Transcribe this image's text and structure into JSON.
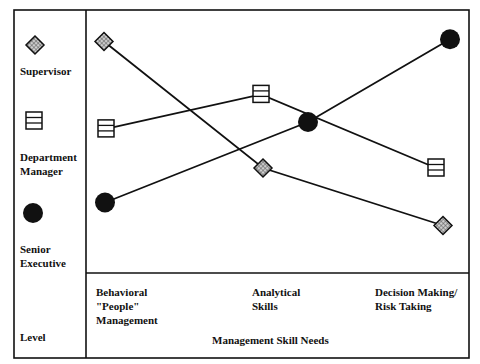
{
  "chart_data": {
    "type": "line",
    "title": "",
    "xlabel": "Management Skill Needs",
    "ylabel": "Level",
    "categories": [
      "Behavioral \"People\" Management",
      "Analytical Skills",
      "Decision Making/ Risk Taking"
    ],
    "category_lines": [
      [
        "Behavioral",
        "\"People\"",
        "Management"
      ],
      [
        "Analytical",
        "Skills"
      ],
      [
        "Decision Making/",
        "Risk Taking"
      ]
    ],
    "y_scale": "relative importance (unlabeled, higher = more needed)",
    "ylim": [
      0,
      10
    ],
    "series": [
      {
        "name": "Supervisor",
        "marker": "hatched-diamond",
        "values": [
          9.5,
          4.0,
          1.5
        ]
      },
      {
        "name": "Department Manager",
        "marker": "striped-square",
        "values": [
          5.7,
          7.2,
          4.0
        ]
      },
      {
        "name": "Senior Executive",
        "marker": "filled-circle",
        "values": [
          2.5,
          6.0,
          9.6
        ]
      }
    ],
    "legend": {
      "position": "left",
      "entries": [
        {
          "label_lines": [
            "Supervisor"
          ],
          "marker": "hatched-diamond"
        },
        {
          "label_lines": [
            "Department",
            "Manager"
          ],
          "marker": "striped-square"
        },
        {
          "label_lines": [
            "Senior",
            "Executive"
          ],
          "marker": "filled-circle"
        }
      ]
    },
    "grid": false
  },
  "labels": {
    "legend_title": "Level",
    "x_axis_title": "Management Skill Needs",
    "legend_supervisor": "Supervisor",
    "legend_dept_1": "Department",
    "legend_dept_2": "Manager",
    "legend_senior_1": "Senior",
    "legend_senior_2": "Executive",
    "cat1_1": "Behavioral",
    "cat1_2": "\"People\"",
    "cat1_3": "Management",
    "cat2_1": "Analytical",
    "cat2_2": "Skills",
    "cat3_1": "Decision Making/",
    "cat3_2": "Risk Taking"
  },
  "colors": {
    "line": "#111111",
    "background": "#ffffff",
    "marker_fill": "#111111",
    "hatch": "#888888"
  }
}
